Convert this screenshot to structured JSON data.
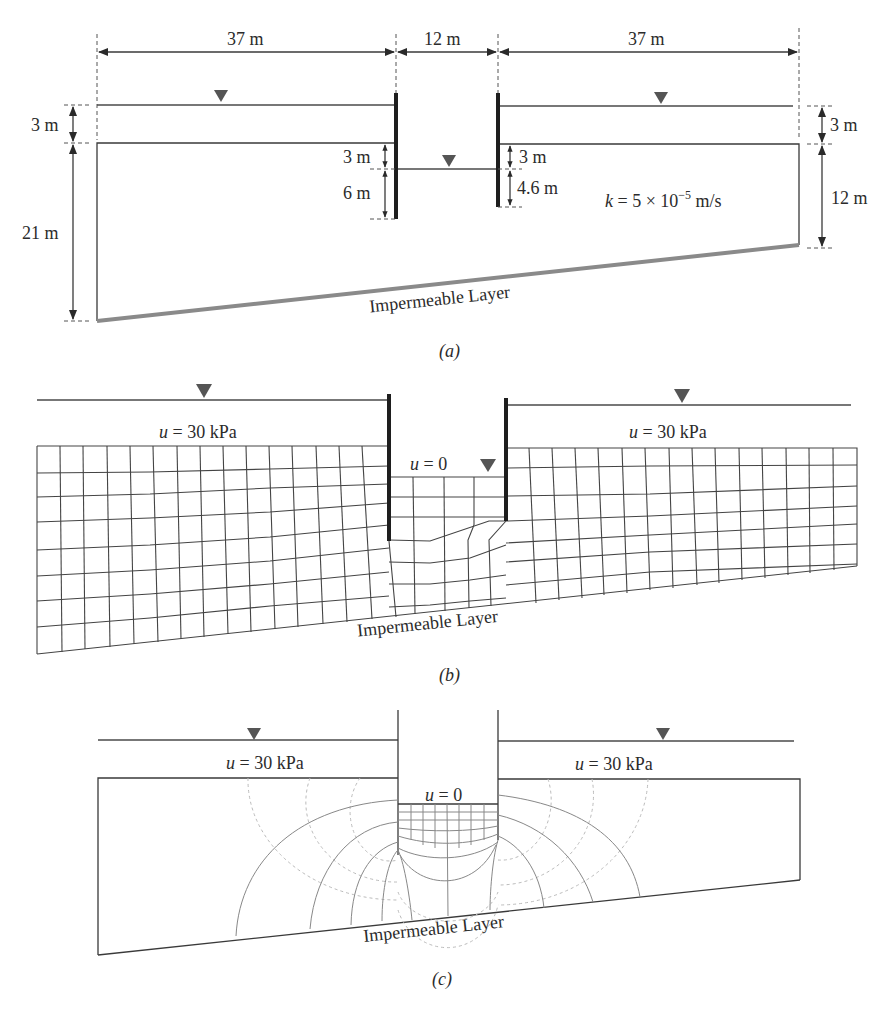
{
  "panel_a": {
    "caption": "(a)",
    "dim_left_width": "37 m",
    "dim_mid_width": "12 m",
    "dim_right_width": "37 m",
    "dim_left_water": "3 m",
    "dim_left_depth": "21 m",
    "dim_wall_left_top": "3 m",
    "dim_wall_left_bottom": "6 m",
    "dim_wall_right_top": "3 m",
    "dim_wall_right_bottom": "4.6 m",
    "dim_right_water": "3 m",
    "dim_right_depth": "12 m",
    "permeability_prefix": "k",
    "permeability_value": " = 5 × 10",
    "permeability_exp": "−5",
    "permeability_unit": " m/s",
    "impermeable_label": "Impermeable Layer"
  },
  "panel_b": {
    "caption": "(b)",
    "left_pressure": "u = 30 kPa",
    "right_pressure": "u = 30 kPa",
    "excavation_pressure": "u = 0",
    "impermeable_label": "Impermeable Layer"
  },
  "panel_c": {
    "caption": "(c)",
    "left_pressure": "u = 30 kPa",
    "right_pressure": "u = 30 kPa",
    "excavation_pressure": "u = 0",
    "impermeable_label": "Impermeable Layer"
  },
  "colors": {
    "line": "#3a3a3a",
    "wall": "#1e1e1e",
    "impermeable": "#8a8a8a",
    "water_marker": "#555555",
    "equipotential": "#bbbbbb"
  }
}
